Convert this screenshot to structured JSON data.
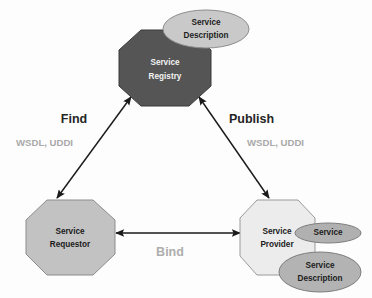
{
  "diagram": {
    "type": "soa-triangle",
    "background_color": "#fdfdfd",
    "nodes": [
      {
        "id": "service-registry",
        "shape": "octagon",
        "label_line1": "Service",
        "label_line2": "Registry",
        "fill": "#555555",
        "stroke": "#3b3b3b",
        "text_color": "#f2f2f2",
        "cx": 165,
        "cy": 68,
        "rx": 46,
        "ry": 38
      },
      {
        "id": "service-requestor",
        "shape": "octagon",
        "label_line1": "Service",
        "label_line2": "Requestor",
        "fill": "#c2c2c2",
        "stroke": "#8d8d8d",
        "text_color": "#1b1b1b",
        "cx": 70,
        "cy": 237,
        "rx": 45,
        "ry": 38
      },
      {
        "id": "service-provider",
        "shape": "octagon",
        "label_line1": "Service",
        "label_line2": "Provider",
        "fill": "#ececec",
        "stroke": "#9a9a9a",
        "text_color": "#1b1b1b",
        "cx": 277,
        "cy": 237,
        "rx": 38,
        "ry": 38
      }
    ],
    "ellipses": [
      {
        "id": "registry-service-description",
        "label_line1": "Service",
        "label_line2": "Description",
        "fill": "#c9c9c9",
        "stroke": "#8c8c8c",
        "cx": 206,
        "cy": 29,
        "rx": 43,
        "ry": 19
      },
      {
        "id": "provider-service",
        "label_line1": "Service",
        "label_line2": "",
        "fill": "#b0b0b0",
        "stroke": "#7d7d7d",
        "cx": 328,
        "cy": 233,
        "rx": 33,
        "ry": 10
      },
      {
        "id": "provider-service-description",
        "label_line1": "Service",
        "label_line2": "Description",
        "fill": "#b3b3b3",
        "stroke": "#7d7d7d",
        "cx": 320,
        "cy": 272,
        "rx": 41,
        "ry": 20
      }
    ],
    "connections": [
      {
        "id": "find-edge",
        "title": "Find",
        "subtitle": "WSDL, UDDI",
        "from": "service-requestor",
        "to": "service-registry",
        "arrow": "double",
        "title_x": 74,
        "title_y": 123,
        "sub_x": 16,
        "sub_y": 146,
        "x1": 57,
        "y1": 198,
        "x2": 131,
        "y2": 97
      },
      {
        "id": "publish-edge",
        "title": "Publish",
        "subtitle": "WSDL, UDDI",
        "from": "service-provider",
        "to": "service-registry",
        "arrow": "double",
        "title_x": 229,
        "title_y": 123,
        "sub_x": 247,
        "sub_y": 146,
        "x1": 269,
        "y1": 198,
        "x2": 199,
        "y2": 97
      },
      {
        "id": "bind-edge",
        "title": "Bind",
        "subtitle": "",
        "from": "service-requestor",
        "to": "service-provider",
        "arrow": "double",
        "title_x": 170,
        "title_y": 256,
        "x1": 116,
        "y1": 233,
        "x2": 240,
        "y2": 233
      }
    ],
    "colors": {
      "line": "#1a1a1a",
      "label_dark": "#252525",
      "label_gray": "#adadad",
      "sub_gray": "#a9a9a9"
    }
  }
}
